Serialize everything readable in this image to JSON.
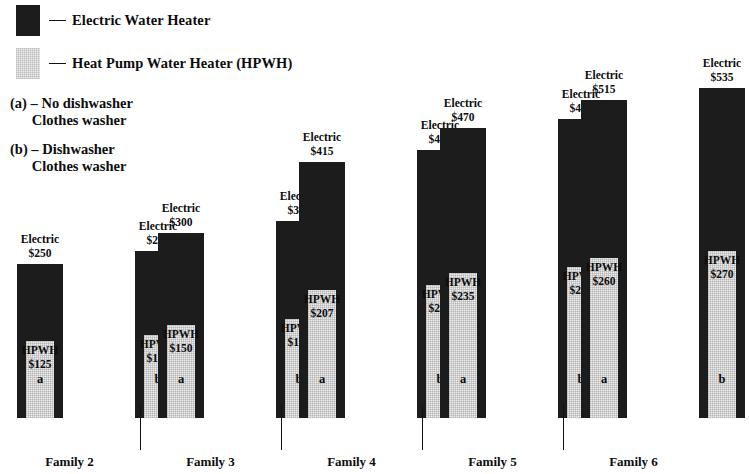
{
  "legend": {
    "items": [
      {
        "swatch": "electric-swatch",
        "dash": "dash-icon",
        "label": "Electric Water Heater"
      },
      {
        "swatch": "hpwh-swatch",
        "dash": "dash-icon",
        "label": "Heat Pump Water Heater (HPWH)"
      }
    ]
  },
  "notes": [
    "(a) – No dishwasher\n      Clothes washer",
    "(b) – Dishwasher\n      Clothes washer"
  ],
  "colors": {
    "electric": "#1c1c1c",
    "hpwh": "#ededed",
    "background": "#ffffff",
    "text": "#0d0d0d"
  },
  "chart_data": {
    "type": "bar",
    "title": "",
    "subtitle": "",
    "xlabel": "",
    "ylabel": "",
    "ylim": [
      0,
      535
    ],
    "grid": false,
    "legend_position": "top-left",
    "categories": [
      "Family 2 a",
      "Family 2 b",
      "Family 3 a",
      "Family 3 b",
      "Family 4 a",
      "Family 4 b",
      "Family 5 a",
      "Family 5 b",
      "Family 6 a",
      "Family 6 b"
    ],
    "series": [
      {
        "name": "Electric Water Heater",
        "values": [
          250,
          270,
          300,
          320,
          415,
          435,
          470,
          485,
          515,
          535
        ]
      },
      {
        "name": "Heat Pump Water Heater (HPWH)",
        "values": [
          125,
          135,
          150,
          160,
          207,
          216,
          235,
          245,
          260,
          270
        ]
      }
    ],
    "groups": [
      {
        "name": "Family 2",
        "bars": [
          {
            "tick": "a",
            "electric_label": "Electric",
            "electric_value": "$250",
            "hpwh_label": "HPWH",
            "hpwh_value": "$125",
            "electric": 250,
            "hpwh": 125
          },
          {
            "tick": "b",
            "electric_label": "Electric",
            "electric_value": "$270",
            "hpwh_label": "HPWH",
            "hpwh_value": "$135",
            "electric": 270,
            "hpwh": 135
          }
        ]
      },
      {
        "name": "Family 3",
        "bars": [
          {
            "tick": "a",
            "electric_label": "Electric",
            "electric_value": "$300",
            "hpwh_label": "HPWH",
            "hpwh_value": "$150",
            "electric": 300,
            "hpwh": 150
          },
          {
            "tick": "b",
            "electric_label": "Electric",
            "electric_value": "$320",
            "hpwh_label": "HPWH",
            "hpwh_value": "$160",
            "electric": 320,
            "hpwh": 160
          }
        ]
      },
      {
        "name": "Family 4",
        "bars": [
          {
            "tick": "a",
            "electric_label": "Electric",
            "electric_value": "$415",
            "hpwh_label": "HPWH",
            "hpwh_value": "$207",
            "electric": 415,
            "hpwh": 207
          },
          {
            "tick": "b",
            "electric_label": "Electric",
            "electric_value": "$435",
            "hpwh_label": "HPWH",
            "hpwh_value": "$216",
            "electric": 435,
            "hpwh": 216
          }
        ]
      },
      {
        "name": "Family 5",
        "bars": [
          {
            "tick": "a",
            "electric_label": "Electric",
            "electric_value": "$470",
            "hpwh_label": "HPWH",
            "hpwh_value": "$235",
            "electric": 470,
            "hpwh": 235
          },
          {
            "tick": "b",
            "electric_label": "Electric",
            "electric_value": "$485",
            "hpwh_label": "HPWH",
            "hpwh_value": "$245",
            "electric": 485,
            "hpwh": 245
          }
        ]
      },
      {
        "name": "Family 6",
        "bars": [
          {
            "tick": "a",
            "electric_label": "Electric",
            "electric_value": "$515",
            "hpwh_label": "HPWH",
            "hpwh_value": "$260",
            "electric": 515,
            "hpwh": 260
          },
          {
            "tick": "b",
            "electric_label": "Electric",
            "electric_value": "$535",
            "hpwh_label": "HPWH",
            "hpwh_value": "$270",
            "electric": 535,
            "hpwh": 270
          }
        ]
      }
    ]
  }
}
